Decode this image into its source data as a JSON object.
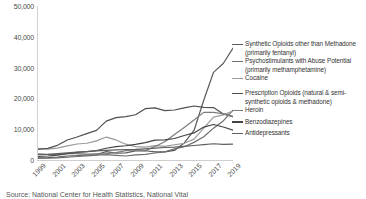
{
  "caption": "Source: National Center for Health Statistics, National Vital",
  "legend": {
    "groups": [
      {
        "entries": [
          {
            "label": "Synthetic Opioids other than Methadone",
            "continuation": "(primarily fentanyl)",
            "color": "#5a5a5a"
          },
          {
            "label": "Psychostimulants with Abuse Potential",
            "continuation": "(primarily methamphetamine)",
            "color": "#6e6e6e"
          },
          {
            "label": "Cocaine",
            "continuation": "",
            "color": "#9a9a9a"
          }
        ]
      },
      {
        "entries": [
          {
            "label": "Prescription Opioids (natural & semi-",
            "continuation": "synthetic opioids & methadone)",
            "color": "#4f4f4f"
          },
          {
            "label": "Heroin",
            "continuation": "",
            "color": "#7c7c7c"
          }
        ]
      },
      {
        "entries": [
          {
            "label": "Benzodiazepines",
            "continuation": "",
            "color": "#444444"
          }
        ]
      },
      {
        "entries": [
          {
            "label": "Antidepressants",
            "continuation": "",
            "color": "#5f5f5f"
          }
        ]
      }
    ]
  },
  "chart_data": {
    "type": "line",
    "title": "",
    "xlabel": "",
    "ylabel": "",
    "x": [
      1999,
      2000,
      2001,
      2002,
      2003,
      2004,
      2005,
      2006,
      2007,
      2008,
      2009,
      2010,
      2011,
      2012,
      2013,
      2014,
      2015,
      2016,
      2017,
      2018,
      2019
    ],
    "xticks": [
      "1999",
      "2001",
      "2003",
      "2005",
      "2007",
      "2009",
      "2011",
      "2013",
      "2015",
      "2017",
      "2019"
    ],
    "yticks": [
      "0",
      "10,000",
      "20,000",
      "30,000",
      "40,000",
      "50,000"
    ],
    "ylim": [
      0,
      50000
    ],
    "xlim": [
      1999,
      2019
    ],
    "grid": false,
    "legend_position": "right",
    "series": [
      {
        "name": "Synthetic Opioids other than Methadone (primarily fentanyl)",
        "color": "#5a5a5a",
        "values": [
          730,
          782,
          957,
          1295,
          1400,
          1664,
          1742,
          2707,
          2213,
          2306,
          2946,
          3007,
          2666,
          2628,
          3105,
          5544,
          9580,
          19413,
          28466,
          31335,
          36359
        ]
      },
      {
        "name": "Psychostimulants with Abuse Potential (primarily methamphetamine)",
        "color": "#6e6e6e",
        "values": [
          547,
          573,
          694,
          896,
          1140,
          1371,
          1608,
          1756,
          1497,
          1304,
          1632,
          1854,
          2266,
          2635,
          3627,
          4298,
          5716,
          7542,
          10333,
          12676,
          16167
        ]
      },
      {
        "name": "Cocaine",
        "color": "#9a9a9a",
        "values": [
          3822,
          3544,
          3833,
          4599,
          5196,
          5443,
          6208,
          7448,
          6512,
          5129,
          4350,
          4183,
          4681,
          4404,
          4944,
          5415,
          6784,
          10375,
          13942,
          14666,
          15883
        ]
      },
      {
        "name": "Prescription Opioids (natural & semi-synthetic opioids & methadone)",
        "color": "#4f4f4f",
        "values": [
          3442,
          3785,
          4770,
          6482,
          7460,
          8577,
          9612,
          12629,
          13741,
          14068,
          14684,
          16651,
          16917,
          16007,
          16235,
          16941,
          17536,
          17087,
          17029,
          14975,
          14139
        ]
      },
      {
        "name": "Heroin",
        "color": "#7c7c7c",
        "values": [
          1960,
          1842,
          1779,
          2089,
          2080,
          1878,
          2009,
          2088,
          2399,
          3041,
          3278,
          3036,
          4397,
          5925,
          8257,
          10574,
          12989,
          15469,
          15482,
          14996,
          14019
        ]
      },
      {
        "name": "Benzodiazepines",
        "color": "#444444",
        "values": [
          1135,
          1298,
          1591,
          2054,
          2460,
          2750,
          3074,
          3825,
          4368,
          4619,
          5070,
          5652,
          6438,
          6524,
          6973,
          7945,
          8791,
          10684,
          11537,
          10724,
          9711
        ]
      },
      {
        "name": "Antidepressants",
        "color": "#5f5f5f",
        "values": [
          1749,
          1849,
          2065,
          2294,
          2532,
          2735,
          2958,
          3127,
          3270,
          3413,
          3447,
          3626,
          3854,
          4059,
          4182,
          4420,
          4714,
          5021,
          5269,
          5064,
          5175
        ]
      }
    ]
  }
}
